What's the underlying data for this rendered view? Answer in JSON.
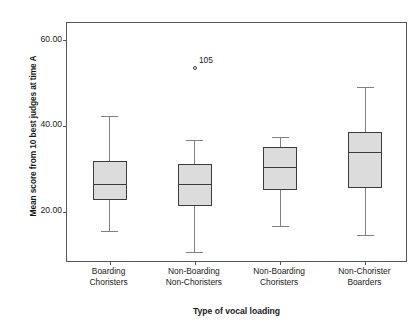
{
  "chart_data": {
    "type": "box",
    "title": "",
    "xlabel": "Type of vocal loading",
    "ylabel": "Mean score from 10 best judges at time A",
    "ylim": [
      8,
      64
    ],
    "yticks": [
      20.0,
      40.0,
      60.0
    ],
    "ytick_labels": [
      "20.00",
      "40.00",
      "60.00"
    ],
    "grid": false,
    "legend": "none",
    "categories": [
      "Boarding Choristers",
      "Non-Boarding Non-Choristers",
      "Non-Boarding Choristers",
      "Non-Chorister Boarders"
    ],
    "boxes": [
      {
        "category": "Boarding Choristers",
        "min": 15.5,
        "q1": 22.6,
        "median": 26.5,
        "q3": 31.9,
        "max": 42.4,
        "outliers": []
      },
      {
        "category": "Non-Boarding Non-Choristers",
        "min": 10.6,
        "q1": 21.4,
        "median": 26.5,
        "q3": 31.1,
        "max": 36.8,
        "outliers": [
          {
            "label": "105",
            "value": 53.5
          }
        ]
      },
      {
        "category": "Non-Boarding Choristers",
        "min": 16.6,
        "q1": 25.0,
        "median": 30.5,
        "q3": 35.0,
        "max": 37.3,
        "outliers": []
      },
      {
        "category": "Non-Chorister Boarders",
        "min": 14.6,
        "q1": 25.6,
        "median": 34.0,
        "q3": 38.6,
        "max": 49.0,
        "outliers": []
      }
    ],
    "colors": {
      "box_fill": "#dcdcdc",
      "box_edge": "#3c3c3c",
      "whisker": "#808080",
      "frame": "#555555",
      "text": "#1a1a1a"
    }
  }
}
